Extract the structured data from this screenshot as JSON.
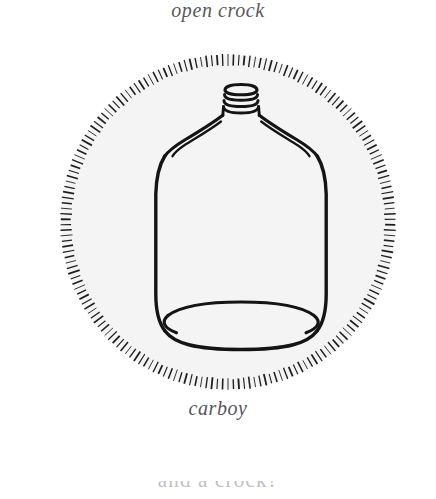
{
  "figure": {
    "kind": "line-drawing-plate",
    "subject": "carboy",
    "caption_top": "open crock",
    "caption_bottom": "carboy",
    "bottom_cut_text": "and a  crock?",
    "vignette": {
      "shape": "circle",
      "border_style": "radial-hatch-ticks",
      "tick_count": 190,
      "center_x": 176,
      "center_y": 176,
      "radius": 168,
      "tick_length": 12
    },
    "colors": {
      "page_background": "#ffffff",
      "plate_fill": "#f4f4f4",
      "ink": "#1a1a1a",
      "caption_text": "#55555a",
      "hatch": "#222222"
    }
  }
}
